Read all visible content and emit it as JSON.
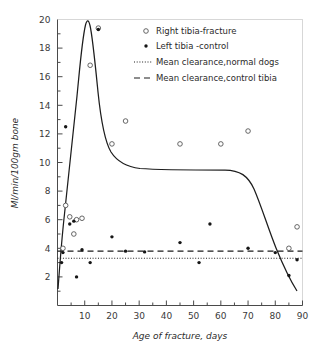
{
  "chart_data": {
    "type": "scatter",
    "title": "",
    "xlabel": "Age of fracture, days",
    "ylabel": "Ml/min/100gm bone",
    "xlim": [
      0,
      90
    ],
    "ylim": [
      0,
      20
    ],
    "xticks": [
      10,
      20,
      30,
      40,
      50,
      60,
      70,
      80,
      90
    ],
    "yticks": [
      2,
      4,
      6,
      8,
      10,
      12,
      14,
      16,
      18,
      20
    ],
    "xminor_step": 5,
    "yminor_step": 1,
    "grid": false,
    "legend_position": "top-right",
    "series": [
      {
        "name": "Right tibia-fracture",
        "marker": "open-circle",
        "points": [
          [
            2.0,
            4.0
          ],
          [
            3.0,
            7.0
          ],
          [
            4.5,
            6.2
          ],
          [
            6.0,
            5.0
          ],
          [
            7.0,
            6.0
          ],
          [
            9.0,
            6.1
          ],
          [
            12.0,
            16.8
          ],
          [
            15.0,
            19.4
          ],
          [
            20.0,
            11.3
          ],
          [
            25.0,
            12.9
          ],
          [
            45.0,
            11.3
          ],
          [
            60.0,
            11.3
          ],
          [
            70.0,
            12.2
          ],
          [
            85.0,
            4.0
          ],
          [
            88.0,
            5.5
          ]
        ]
      },
      {
        "name": "Left tibia -control",
        "marker": "filled-circle",
        "points": [
          [
            1.5,
            3.0
          ],
          [
            2.0,
            3.7
          ],
          [
            3.0,
            12.5
          ],
          [
            4.5,
            5.7
          ],
          [
            6.0,
            5.9
          ],
          [
            7.0,
            2.0
          ],
          [
            9.0,
            3.9
          ],
          [
            12.0,
            3.0
          ],
          [
            15.0,
            19.3
          ],
          [
            20.0,
            4.8
          ],
          [
            25.0,
            3.8
          ],
          [
            32.0,
            3.75
          ],
          [
            45.0,
            4.4
          ],
          [
            52.0,
            3.0
          ],
          [
            56.0,
            5.7
          ],
          [
            70.0,
            4.0
          ],
          [
            80.0,
            3.7
          ],
          [
            85.0,
            2.1
          ],
          [
            88.0,
            3.2
          ]
        ]
      }
    ],
    "fit_curve": {
      "name": "fracture-trend-curve",
      "description": "smooth fitted curve through fracture data"
    },
    "reference_lines": [
      {
        "name": "Mean clearance,normal dogs",
        "style": "dotted",
        "value": 3.3
      },
      {
        "name": "Mean clearance,control tibia",
        "style": "dashed",
        "value": 3.8
      }
    ]
  },
  "legend": {
    "entries": [
      {
        "label": "Right tibia-fracture",
        "marker": "open-circle"
      },
      {
        "label": "Left tibia -control",
        "marker": "filled-circle"
      },
      {
        "label": "Mean clearance,normal dogs",
        "marker": "dotted-line"
      },
      {
        "label": "Mean clearance,control tibia",
        "marker": "dashed-line"
      }
    ]
  },
  "axes": {
    "x_title": "Age of fracture, days",
    "y_title": "Ml/min/100gm bone",
    "x_tick_labels": [
      "10",
      "20",
      "30",
      "40",
      "50",
      "60",
      "70",
      "80",
      "90"
    ],
    "y_tick_labels": [
      "2",
      "4",
      "6",
      "8",
      "10",
      "12",
      "14",
      "16",
      "18",
      "20"
    ]
  },
  "colors": {
    "curve": "#1d1d1d",
    "axis": "#4a4a4a",
    "text": "#2b2b2b",
    "background": "#ffffff"
  }
}
